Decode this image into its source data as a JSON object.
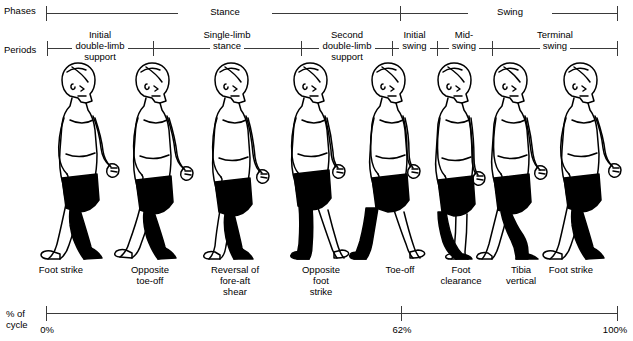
{
  "diagram": {
    "row_labels": {
      "phases": "Phases",
      "periods": "Periods",
      "percent_line1": "% of",
      "percent_line2": "cycle"
    },
    "phases": [
      {
        "label": "Stance",
        "start_pct": 0,
        "end_pct": 62
      },
      {
        "label": "Swing",
        "start_pct": 62,
        "end_pct": 100
      }
    ],
    "periods": [
      {
        "label": "Initial double-limb support",
        "lines": [
          "Initial",
          "double-limb",
          "support"
        ],
        "start_pct": 0,
        "end_pct": 18
      },
      {
        "label": "Single-limb stance",
        "lines": [
          "Single-limb",
          "stance"
        ],
        "start_pct": 18,
        "end_pct": 44
      },
      {
        "label": "Second double-limb support",
        "lines": [
          "Second",
          "double-limb",
          "support"
        ],
        "start_pct": 44,
        "end_pct": 60
      },
      {
        "label": "Initial swing",
        "lines": [
          "Initial",
          "swing"
        ],
        "start_pct": 60,
        "end_pct": 68
      },
      {
        "label": "Mid-swing",
        "lines": [
          "Mid-",
          "swing"
        ],
        "start_pct": 68,
        "end_pct": 78
      },
      {
        "label": "Terminal swing",
        "lines": [
          "Terminal",
          "swing"
        ],
        "start_pct": 78,
        "end_pct": 100
      }
    ],
    "events": [
      {
        "lines": [
          "Foot strike"
        ],
        "pct": 2
      },
      {
        "lines": [
          "Opposite",
          "toe-off"
        ],
        "pct": 18
      },
      {
        "lines": [
          "Reversal of",
          "fore-aft",
          "shear"
        ],
        "pct": 32
      },
      {
        "lines": [
          "Opposite",
          "foot",
          "strike"
        ],
        "pct": 46
      },
      {
        "lines": [
          "Toe-off"
        ],
        "pct": 59
      },
      {
        "lines": [
          "Foot",
          "clearance"
        ],
        "pct": 68
      },
      {
        "lines": [
          "Tibia",
          "vertical"
        ],
        "pct": 77
      },
      {
        "lines": [
          "Foot strike"
        ],
        "pct": 92
      }
    ],
    "percent_scale": {
      "ticks": [
        {
          "label": "0%",
          "pct": 0
        },
        {
          "label": "62%",
          "pct": 62
        },
        {
          "label": "100%",
          "pct": 100
        }
      ]
    },
    "figures": [
      {
        "name": "figure-foot-strike",
        "stance_side": "near",
        "caption_ref": 0
      },
      {
        "name": "figure-opposite-toe-off",
        "stance_side": "near",
        "caption_ref": 1
      },
      {
        "name": "figure-reversal-fore-aft-shear",
        "stance_side": "near",
        "caption_ref": 2
      },
      {
        "name": "figure-opposite-foot-strike",
        "stance_side": "near",
        "caption_ref": 3
      },
      {
        "name": "figure-toe-off",
        "stance_side": "near",
        "caption_ref": 4
      },
      {
        "name": "figure-foot-clearance",
        "stance_side": "near",
        "caption_ref": 5
      },
      {
        "name": "figure-tibia-vertical",
        "stance_side": "near",
        "caption_ref": 6
      },
      {
        "name": "figure-foot-strike-end",
        "stance_side": "near",
        "caption_ref": 7
      }
    ],
    "colors": {
      "line": "#3a3a3a",
      "outline": "#000000",
      "limb_fill": "#000000",
      "background": "#ffffff"
    }
  }
}
